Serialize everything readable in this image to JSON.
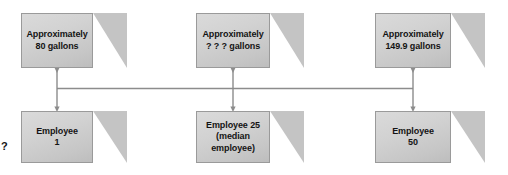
{
  "diagram": {
    "type": "flow-diagram",
    "title": "",
    "background_color": "#ffffff",
    "box_fill_color": "#d2d2d2",
    "box_border_color": "#9a9a9a",
    "box_fold_color": "#c4c4c4",
    "connector_color": "#8c8c8c",
    "text_color": "#141414",
    "stray_marker": "?",
    "top_row": [
      {
        "id": "approx-80-gallons",
        "line1": "Approximately",
        "line2": "80 gallons",
        "label": "Approximately\n80 gallons",
        "value": "80",
        "unit": "gallons",
        "x": 21,
        "y": 13,
        "width": 72,
        "height": 55
      },
      {
        "id": "approx-unknown-gallons",
        "line1": "Approximately",
        "line2": "? ? ? gallons",
        "label": "Approximately\n? ? ? gallons",
        "value": "? ? ?",
        "unit": "gallons",
        "x": 196,
        "y": 13,
        "width": 74,
        "height": 55
      },
      {
        "id": "approx-1499-gallons",
        "line1": "Approximately",
        "line2": "149.9 gallons",
        "label": "Approximately\n149.9 gallons",
        "value": "149.9",
        "unit": "gallons",
        "x": 375,
        "y": 13,
        "width": 76,
        "height": 55
      }
    ],
    "bottom_row": [
      {
        "id": "employee-1",
        "line1": "Employee",
        "line2": "1",
        "label": "Employee\n1",
        "x": 21,
        "y": 111,
        "width": 72,
        "height": 52
      },
      {
        "id": "employee-25-median",
        "line1": "Employee 25",
        "line2": "(median employee)",
        "label": "Employee 25\n(median employee)",
        "x": 196,
        "y": 111,
        "width": 74,
        "height": 52
      },
      {
        "id": "employee-50",
        "line1": "Employee",
        "line2": "50",
        "label": "Employee\n50",
        "x": 375,
        "y": 111,
        "width": 76,
        "height": 52
      }
    ],
    "connectors": [
      {
        "id": "arrow-left",
        "type": "double-arrow-vertical",
        "x": 57,
        "from_y": 70,
        "to_y": 109
      },
      {
        "id": "arrow-middle",
        "type": "double-arrow-vertical",
        "x": 233,
        "from_y": 70,
        "to_y": 109
      },
      {
        "id": "arrow-right",
        "type": "double-arrow-vertical",
        "x": 413,
        "from_y": 70,
        "to_y": 109
      },
      {
        "id": "baseline",
        "type": "horizontal-line",
        "y": 88,
        "from_x": 57,
        "to_x": 413
      }
    ]
  }
}
